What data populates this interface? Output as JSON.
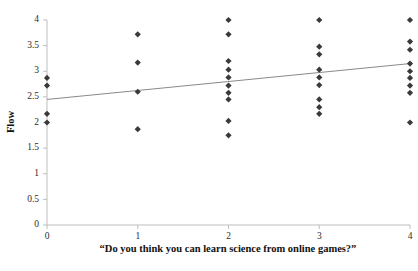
{
  "chart_data": {
    "type": "scatter",
    "title": "",
    "xlabel": "“Do you think you can learn science from online games?”",
    "ylabel": "Flow",
    "xlim": [
      0,
      4
    ],
    "ylim": [
      0,
      4
    ],
    "xticks": [
      "0",
      "1",
      "2",
      "3",
      "4"
    ],
    "yticks": [
      "0",
      "0.5",
      "1",
      "1.5",
      "2",
      "2.5",
      "3",
      "3.5",
      "4"
    ],
    "grid": false,
    "legend": "none",
    "marker_shape": "diamond",
    "marker_color": "#3a3a3a",
    "points": [
      {
        "x": 0,
        "y": 2.87
      },
      {
        "x": 0,
        "y": 2.72
      },
      {
        "x": 0,
        "y": 2.17
      },
      {
        "x": 0,
        "y": 2.0
      },
      {
        "x": 1,
        "y": 3.72
      },
      {
        "x": 1,
        "y": 3.17
      },
      {
        "x": 1,
        "y": 2.6
      },
      {
        "x": 1,
        "y": 1.87
      },
      {
        "x": 2,
        "y": 4.0
      },
      {
        "x": 2,
        "y": 3.72
      },
      {
        "x": 2,
        "y": 3.2
      },
      {
        "x": 2,
        "y": 3.03
      },
      {
        "x": 2,
        "y": 2.88
      },
      {
        "x": 2,
        "y": 2.72
      },
      {
        "x": 2,
        "y": 2.58
      },
      {
        "x": 2,
        "y": 2.45
      },
      {
        "x": 2,
        "y": 2.03
      },
      {
        "x": 2,
        "y": 1.75
      },
      {
        "x": 3,
        "y": 4.0
      },
      {
        "x": 3,
        "y": 3.48
      },
      {
        "x": 3,
        "y": 3.33
      },
      {
        "x": 3,
        "y": 3.03
      },
      {
        "x": 3,
        "y": 2.88
      },
      {
        "x": 3,
        "y": 2.73
      },
      {
        "x": 3,
        "y": 2.45
      },
      {
        "x": 3,
        "y": 2.3
      },
      {
        "x": 3,
        "y": 2.17
      },
      {
        "x": 4,
        "y": 4.0
      },
      {
        "x": 4,
        "y": 3.58
      },
      {
        "x": 4,
        "y": 3.42
      },
      {
        "x": 4,
        "y": 3.15
      },
      {
        "x": 4,
        "y": 3.0
      },
      {
        "x": 4,
        "y": 2.87
      },
      {
        "x": 4,
        "y": 2.72
      },
      {
        "x": 4,
        "y": 2.58
      },
      {
        "x": 4,
        "y": 2.0
      }
    ],
    "trendline": {
      "x0": 0,
      "y0": 2.45,
      "x1": 4,
      "y1": 3.15,
      "color": "#8a8a8a"
    }
  }
}
